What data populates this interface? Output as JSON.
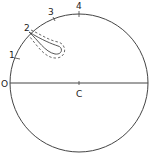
{
  "diagram": {
    "labels": {
      "origin": "O",
      "center": "C",
      "p1": "1",
      "p2": "2",
      "p3": "3",
      "p4": "4"
    },
    "colors": {
      "stroke": "#333333",
      "background": "#ffffff"
    }
  }
}
